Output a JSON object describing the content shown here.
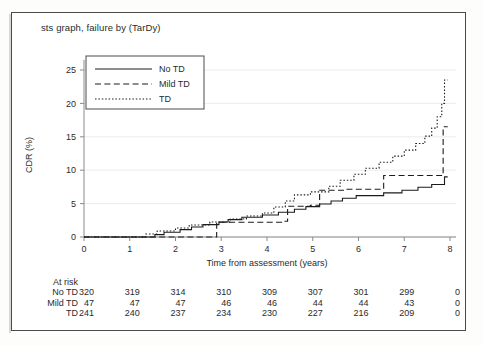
{
  "figure": {
    "title": "sts graph, failure by (TarDy)",
    "border": true
  },
  "legend": {
    "entries": [
      {
        "label": "No TD",
        "style": "solid"
      },
      {
        "label": "Mild TD",
        "style": "dashed"
      },
      {
        "label": "TD",
        "style": "dotted"
      }
    ]
  },
  "risk_table": {
    "header": "At risk",
    "row_labels": [
      "No TD",
      "Mild TD",
      "TD"
    ],
    "times": [
      0,
      1,
      2,
      3,
      4,
      5,
      6,
      7,
      8
    ],
    "rows": [
      {
        "label": "No TD",
        "counts": [
          320,
          319,
          314,
          310,
          309,
          307,
          301,
          299,
          0
        ]
      },
      {
        "label": "Mild TD",
        "counts": [
          47,
          47,
          47,
          46,
          46,
          44,
          44,
          43,
          0
        ]
      },
      {
        "label": "TD",
        "counts": [
          241,
          240,
          237,
          234,
          230,
          227,
          216,
          209,
          0
        ]
      }
    ]
  },
  "chart_data": {
    "type": "line",
    "title": "sts graph, failure by (TarDy)",
    "xlabel": "Time from assessment (years)",
    "ylabel": "CDR (%)",
    "xlim": [
      0,
      8
    ],
    "ylim": [
      0,
      26.5
    ],
    "xticks": [
      0,
      1,
      2,
      3,
      4,
      5,
      6,
      7,
      8
    ],
    "yticks": [
      0,
      5,
      10,
      15,
      20,
      25
    ],
    "grid": "horizontal-faint",
    "legend_position": "top-left",
    "step_type": "post",
    "series": [
      {
        "name": "No TD",
        "style": "solid",
        "points": [
          [
            0.0,
            0.0
          ],
          [
            1.55,
            0.0
          ],
          [
            1.55,
            0.35
          ],
          [
            1.75,
            0.35
          ],
          [
            1.75,
            0.7
          ],
          [
            2.1,
            0.7
          ],
          [
            2.1,
            1.1
          ],
          [
            2.35,
            1.1
          ],
          [
            2.35,
            1.5
          ],
          [
            2.6,
            1.5
          ],
          [
            2.6,
            1.85
          ],
          [
            2.95,
            1.85
          ],
          [
            2.95,
            2.25
          ],
          [
            3.15,
            2.25
          ],
          [
            3.15,
            2.6
          ],
          [
            3.45,
            2.6
          ],
          [
            3.45,
            2.95
          ],
          [
            3.9,
            2.95
          ],
          [
            3.9,
            3.3
          ],
          [
            4.25,
            3.3
          ],
          [
            4.25,
            3.7
          ],
          [
            4.6,
            3.7
          ],
          [
            4.6,
            4.15
          ],
          [
            4.85,
            4.15
          ],
          [
            4.85,
            4.55
          ],
          [
            5.15,
            4.55
          ],
          [
            5.15,
            4.95
          ],
          [
            5.4,
            4.95
          ],
          [
            5.4,
            5.4
          ],
          [
            5.65,
            5.4
          ],
          [
            5.65,
            5.8
          ],
          [
            5.95,
            5.8
          ],
          [
            5.95,
            6.2
          ],
          [
            6.55,
            6.2
          ],
          [
            6.55,
            6.6
          ],
          [
            6.95,
            6.6
          ],
          [
            6.95,
            7.0
          ],
          [
            7.3,
            7.0
          ],
          [
            7.3,
            7.45
          ],
          [
            7.6,
            7.45
          ],
          [
            7.6,
            7.85
          ],
          [
            7.88,
            7.85
          ],
          [
            7.88,
            9.0
          ],
          [
            7.95,
            9.0
          ]
        ]
      },
      {
        "name": "Mild TD",
        "style": "dashed",
        "points": [
          [
            0.0,
            0.0
          ],
          [
            2.9,
            0.0
          ],
          [
            2.9,
            2.2
          ],
          [
            4.35,
            2.2
          ],
          [
            4.35,
            2.35
          ],
          [
            4.45,
            2.35
          ],
          [
            4.45,
            4.6
          ],
          [
            4.95,
            4.6
          ],
          [
            4.95,
            4.75
          ],
          [
            5.15,
            4.75
          ],
          [
            5.15,
            7.0
          ],
          [
            5.75,
            7.0
          ],
          [
            5.75,
            7.15
          ],
          [
            6.55,
            7.15
          ],
          [
            6.55,
            9.2
          ],
          [
            7.85,
            9.2
          ],
          [
            7.85,
            16.5
          ],
          [
            7.95,
            16.5
          ]
        ]
      },
      {
        "name": "TD",
        "style": "dotted",
        "points": [
          [
            0.0,
            0.0
          ],
          [
            1.35,
            0.0
          ],
          [
            1.35,
            0.45
          ],
          [
            1.6,
            0.45
          ],
          [
            1.6,
            0.9
          ],
          [
            2.0,
            0.9
          ],
          [
            2.0,
            1.35
          ],
          [
            2.3,
            1.35
          ],
          [
            2.3,
            1.8
          ],
          [
            2.75,
            1.8
          ],
          [
            2.75,
            2.25
          ],
          [
            3.2,
            2.25
          ],
          [
            3.2,
            2.7
          ],
          [
            3.55,
            2.7
          ],
          [
            3.55,
            3.15
          ],
          [
            3.9,
            3.15
          ],
          [
            3.9,
            3.6
          ],
          [
            4.15,
            3.6
          ],
          [
            4.15,
            4.5
          ],
          [
            4.4,
            4.5
          ],
          [
            4.4,
            5.4
          ],
          [
            4.6,
            5.4
          ],
          [
            4.6,
            6.3
          ],
          [
            4.95,
            6.3
          ],
          [
            4.95,
            6.75
          ],
          [
            5.35,
            6.75
          ],
          [
            5.35,
            7.6
          ],
          [
            5.6,
            7.6
          ],
          [
            5.6,
            8.5
          ],
          [
            5.9,
            8.5
          ],
          [
            5.9,
            9.4
          ],
          [
            6.15,
            9.4
          ],
          [
            6.15,
            10.3
          ],
          [
            6.45,
            10.3
          ],
          [
            6.45,
            11.2
          ],
          [
            6.75,
            11.2
          ],
          [
            6.75,
            12.1
          ],
          [
            7.0,
            12.1
          ],
          [
            7.0,
            13.0
          ],
          [
            7.25,
            13.0
          ],
          [
            7.25,
            14.0
          ],
          [
            7.45,
            14.0
          ],
          [
            7.45,
            15.1
          ],
          [
            7.6,
            15.1
          ],
          [
            7.6,
            16.3
          ],
          [
            7.72,
            16.3
          ],
          [
            7.72,
            18.0
          ],
          [
            7.82,
            18.0
          ],
          [
            7.82,
            20.0
          ],
          [
            7.88,
            20.0
          ],
          [
            7.88,
            23.5
          ],
          [
            7.95,
            23.5
          ]
        ]
      }
    ]
  }
}
